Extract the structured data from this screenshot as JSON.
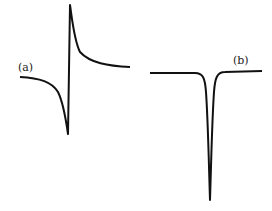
{
  "figure": {
    "panels": [
      {
        "label": "(a)",
        "description": "dispersion-shaped (derivative-like) lineshape"
      },
      {
        "label": "(b)",
        "description": "absorption-shaped inverted Lorentzian dip"
      }
    ],
    "line_color": "#111111",
    "background": "#ffffff"
  }
}
